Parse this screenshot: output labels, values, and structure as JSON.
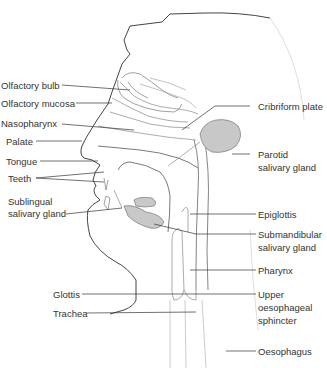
{
  "diagram": {
    "colors": {
      "outline": "#444444",
      "inner": "#888888",
      "leader": "#333333",
      "gland_fill": "#c8c8c8",
      "gland_stroke": "#777777",
      "text": "#333333"
    },
    "left_labels": [
      {
        "id": "olfactory-bulb",
        "text": "Olfactory bulb"
      },
      {
        "id": "olfactory-mucosa",
        "text": "Olfactory mucosa"
      },
      {
        "id": "nasopharynx",
        "text": "Nasopharynx"
      },
      {
        "id": "palate",
        "text": "Palate"
      },
      {
        "id": "tongue",
        "text": "Tongue"
      },
      {
        "id": "teeth",
        "text": "Teeth"
      },
      {
        "id": "sublingual-salivary-gland",
        "line1": "Sublingual",
        "line2": "salivary gland"
      },
      {
        "id": "glottis",
        "text": "Glottis"
      },
      {
        "id": "trachea",
        "text": "Trachea"
      }
    ],
    "right_labels": [
      {
        "id": "cribriform-plate",
        "text": "Cribriform plate"
      },
      {
        "id": "parotid-salivary-gland",
        "line1": "Parotid",
        "line2": "salivary gland"
      },
      {
        "id": "epiglottis",
        "text": "Epiglottis"
      },
      {
        "id": "submandibular-salivary-gland",
        "line1": "Submandibular",
        "line2": "salivary gland"
      },
      {
        "id": "pharynx",
        "text": "Pharynx"
      },
      {
        "id": "upper-oesophageal-sphincter",
        "line1": "Upper",
        "line2": "oesophageal",
        "line3": "sphincter"
      },
      {
        "id": "oesophagus",
        "text": "Oesophagus"
      }
    ]
  }
}
